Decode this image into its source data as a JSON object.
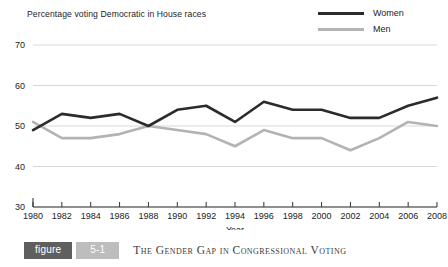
{
  "chart_data": {
    "type": "line",
    "title": "Percentage voting Democratic in House races",
    "xlabel": "Year",
    "ylabel": "",
    "xlim": [
      1980,
      2008
    ],
    "ylim": [
      30,
      70
    ],
    "grid": true,
    "legend_position": "top-right",
    "categories": [
      1980,
      1982,
      1984,
      1986,
      1988,
      1990,
      1992,
      1994,
      1996,
      1998,
      2000,
      2002,
      2004,
      2006,
      2008
    ],
    "xtick_labels": [
      "1980",
      "1982",
      "1984",
      "1986",
      "1988",
      "1990",
      "1992",
      "1994",
      "1996",
      "1998",
      "2000",
      "2002",
      "2004",
      "2006",
      "2008"
    ],
    "ytick_labels": [
      "30",
      "40",
      "50",
      "60",
      "70"
    ],
    "yticks": [
      30,
      40,
      50,
      60,
      70
    ],
    "series": [
      {
        "name": "Women",
        "color": "#2b2b2b",
        "values": [
          49,
          53,
          52,
          53,
          50,
          54,
          55,
          51,
          56,
          54,
          54,
          52,
          52,
          55,
          57
        ]
      },
      {
        "name": "Men",
        "color": "#b3b3b3",
        "values": [
          51,
          47,
          47,
          48,
          50,
          49,
          48,
          45,
          49,
          47,
          47,
          44,
          47,
          51,
          50
        ]
      }
    ]
  },
  "legend": {
    "items": [
      {
        "label": "Women",
        "swatch": "women"
      },
      {
        "label": "Men",
        "swatch": "men"
      }
    ]
  },
  "caption": {
    "figure_word": "figure",
    "figure_number": "5-1",
    "figure_title": "The Gender Gap in Congressional Voting"
  },
  "colors": {
    "women_line": "#2b2b2b",
    "men_line": "#b3b3b3",
    "grid": "#d9d9d9",
    "axis": "#333333",
    "figure_box": "#5f5f5f",
    "number_box": "#bdbdbd"
  }
}
